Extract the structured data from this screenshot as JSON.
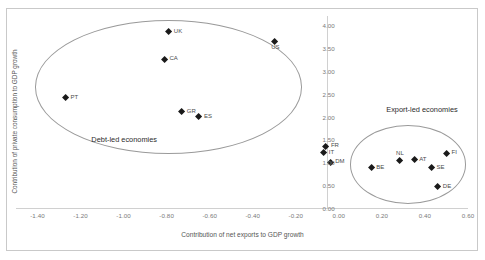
{
  "chart_data": {
    "type": "scatter",
    "title": "",
    "xlabel": "Contribution  of net exports to GDP growth",
    "ylabel": "Contribution of private consumption to GDP growth",
    "xlim": [
      -1.5,
      0.6
    ],
    "ylim": [
      0.0,
      4.2
    ],
    "xticks": [
      "-1.40",
      "-1.20",
      "-1.00",
      "-0.80",
      "-0.60",
      "-0.40",
      "-0.20",
      "0.00",
      "0.20",
      "0.40",
      "0.60"
    ],
    "xtick_values": [
      -1.4,
      -1.2,
      -1.0,
      -0.8,
      -0.6,
      -0.4,
      -0.2,
      0.0,
      0.2,
      0.4,
      0.6
    ],
    "yticks": [
      "0.00",
      "0.50",
      "1.00",
      "1.50",
      "2.00",
      "2.50",
      "3.00",
      "3.50",
      "4.00"
    ],
    "ytick_values": [
      0.0,
      0.5,
      1.0,
      1.5,
      2.0,
      2.5,
      3.0,
      3.5,
      4.0
    ],
    "grid": false,
    "legend": "none",
    "points": [
      {
        "label": "UK",
        "x": -0.79,
        "y": 3.86,
        "label_pos": "right"
      },
      {
        "label": "US",
        "x": -0.3,
        "y": 3.65,
        "label_pos": "below"
      },
      {
        "label": "CA",
        "x": -0.81,
        "y": 3.25,
        "label_pos": "right"
      },
      {
        "label": "PT",
        "x": -1.27,
        "y": 2.41,
        "label_pos": "right"
      },
      {
        "label": "GR",
        "x": -0.73,
        "y": 2.1,
        "label_pos": "right"
      },
      {
        "label": "ES",
        "x": -0.65,
        "y": 2.0,
        "label_pos": "right"
      },
      {
        "label": "FR",
        "x": -0.06,
        "y": 1.35,
        "label_pos": "right"
      },
      {
        "label": "IT",
        "x": -0.07,
        "y": 1.21,
        "label_pos": "right"
      },
      {
        "label": "DM",
        "x": -0.04,
        "y": 1.0,
        "label_pos": "right"
      },
      {
        "label": "BE",
        "x": 0.15,
        "y": 0.88,
        "label_pos": "right"
      },
      {
        "label": "NL",
        "x": 0.28,
        "y": 1.03,
        "label_pos": "above"
      },
      {
        "label": "AT",
        "x": 0.35,
        "y": 1.05,
        "label_pos": "right"
      },
      {
        "label": "SE",
        "x": 0.43,
        "y": 0.88,
        "label_pos": "right"
      },
      {
        "label": "FI",
        "x": 0.5,
        "y": 1.2,
        "label_pos": "right"
      },
      {
        "label": "DE",
        "x": 0.46,
        "y": 0.47,
        "label_pos": "right"
      }
    ],
    "annotations": [
      {
        "text": "Debt-led economies",
        "x": -1.15,
        "y": 1.6
      },
      {
        "text": "Export-led economies",
        "x": 0.22,
        "y": 2.26
      }
    ],
    "groups": [
      {
        "name": "debt-led-ellipse",
        "cx": -0.79,
        "cy": 2.65,
        "rx": 0.62,
        "ry": 1.46
      },
      {
        "name": "export-led-ellipse",
        "cx": 0.32,
        "cy": 0.95,
        "rx": 0.27,
        "ry": 0.86
      }
    ]
  }
}
